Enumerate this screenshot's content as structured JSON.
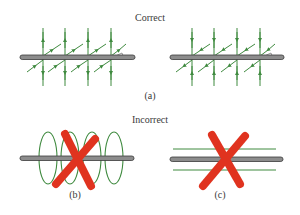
{
  "headings": {
    "correct": "Correct",
    "incorrect": "Incorrect"
  },
  "captions": {
    "a": "(a)",
    "b": "(b)",
    "c": "(c)"
  },
  "colors": {
    "field_line": "#3f8a3f",
    "wire_fill": "#8c8c8c",
    "wire_stroke": "#3a3a3a",
    "cross": "#e0331f",
    "text": "#3a3a3a"
  },
  "panels": [
    {
      "id": "a-left",
      "verdict": "correct",
      "description": "Wire with perpendicular field lines crossing it at regular intervals (vertical and diagonal arrows)"
    },
    {
      "id": "a-right",
      "verdict": "correct",
      "description": "Wire with perpendicular field lines in opposite direction"
    },
    {
      "id": "b",
      "verdict": "incorrect",
      "description": "Circular loops wrapped around the wire, crossed out"
    },
    {
      "id": "c",
      "verdict": "incorrect",
      "description": "Field lines parallel to the wire, crossed out"
    }
  ]
}
